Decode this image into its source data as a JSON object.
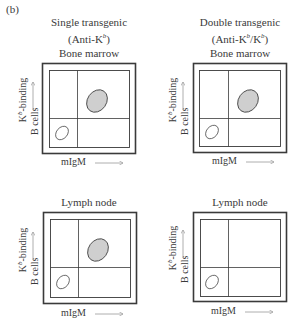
{
  "figure": {
    "panel_label": "(b)",
    "columns": [
      {
        "title": "Single transgenic",
        "subtitle_prefix": "(Anti-K",
        "subtitle_sup": "b",
        "subtitle_suffix": ")"
      },
      {
        "title": "Double transgenic",
        "subtitle_prefix": "(Anti-K",
        "subtitle_sup": "b",
        "subtitle_mid": "/K",
        "subtitle_sup2": "b",
        "subtitle_suffix": ")"
      }
    ],
    "plots": [
      {
        "id": "single-bone-marrow",
        "tissue": "Bone marrow",
        "populations": [
          "IgM-low K^b-low (outline)",
          "IgM-high K^b-binding (shaded)"
        ]
      },
      {
        "id": "double-bone-marrow",
        "tissue": "Bone marrow",
        "populations": [
          "IgM-low K^b-low (outline)",
          "IgM-high K^b-binding (shaded)"
        ]
      },
      {
        "id": "single-lymph-node",
        "tissue": "Lymph node",
        "populations": [
          "IgM-low K^b-low (outline)",
          "IgM-high K^b-binding (shaded)"
        ]
      },
      {
        "id": "double-lymph-node",
        "tissue": "Lymph node",
        "populations": [
          "IgM-low K^b-low (outline)"
        ]
      }
    ],
    "axes": {
      "y_label_line1_prefix": "K",
      "y_label_line1_sup": "b",
      "y_label_line1_suffix": "-binding",
      "y_label_line2": "B cells",
      "x_label": "mIgM"
    },
    "colors": {
      "line": "#3a3a3a",
      "shaded_fill": "#cfcfcf",
      "arrow": "#9a9a9a"
    }
  }
}
